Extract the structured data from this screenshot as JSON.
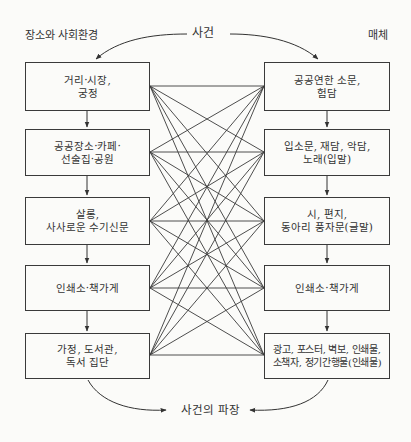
{
  "header": {
    "left_title": "장소와 사회환경",
    "center_title": "사건",
    "right_title": "매체"
  },
  "left_column": {
    "heading": "장소와 사회환경",
    "boxes": [
      {
        "label": "거리·시장,\n궁정"
      },
      {
        "label": "공공장소·카페·\n선술집·공원"
      },
      {
        "label": "살롱,\n사사로운 수기신문"
      },
      {
        "label": "인쇄소·책가게"
      },
      {
        "label": "가정, 도서관,\n독서 집단"
      }
    ]
  },
  "right_column": {
    "heading": "매체",
    "boxes": [
      {
        "label": "공공연한 소문,\n험담"
      },
      {
        "label": "입소문, 재담, 악담,\n노래(입말)"
      },
      {
        "label": "시, 편지,\n동아리 풍자문(글말)"
      },
      {
        "label": "인쇄소·책가게"
      },
      {
        "label": "광고, 포스터, 벽보, 인쇄물,\n소책자, 정기간행물(인쇄물)"
      }
    ]
  },
  "footer": {
    "result_label": "사건의 파장"
  },
  "connections": {
    "type": "complete-bipartite",
    "description": "Every left box connects to every right box",
    "count": 25
  },
  "colors": {
    "background": "#fbfbf9",
    "line": "#333333",
    "text": "#333333"
  }
}
